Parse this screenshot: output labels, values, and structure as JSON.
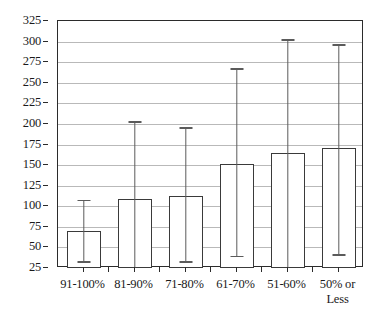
{
  "chart_data": {
    "type": "bar",
    "title": "",
    "subtitle": "",
    "xlabel": "",
    "ylabel": "",
    "categories": [
      "91-100%",
      "81-90%",
      "71-80%",
      "61-70%",
      "51-60%",
      "50% or\nLess"
    ],
    "values": [
      70,
      109,
      113,
      151,
      165,
      171
    ],
    "error_high": [
      108,
      203,
      196,
      268,
      303,
      297
    ],
    "error_low": [
      33,
      25,
      33,
      40,
      25,
      42
    ],
    "ylim": [
      25,
      325
    ],
    "ytick_step": 25,
    "ytick_labels": [
      "325",
      "300",
      "275",
      "250",
      "225",
      "200",
      "175",
      "150",
      "125",
      "100",
      "75",
      "50",
      "25"
    ],
    "ytick_values": [
      325,
      300,
      275,
      250,
      225,
      200,
      175,
      150,
      125,
      100,
      75,
      50,
      25
    ],
    "grid": true,
    "grid_axis": "y",
    "legend": false,
    "legend_position": "none",
    "bar_fill_color": "#ffffff",
    "bar_border_color": "#3a3a3a",
    "errorbar_color": "#5b5b5b",
    "gridline_color": "#b9b9b9",
    "axis_color": "#2b2b2b",
    "background_color": "#ffffff",
    "series": [
      {
        "name": "mean",
        "values": [
          70,
          109,
          113,
          151,
          165,
          171
        ]
      }
    ],
    "annotations": []
  }
}
